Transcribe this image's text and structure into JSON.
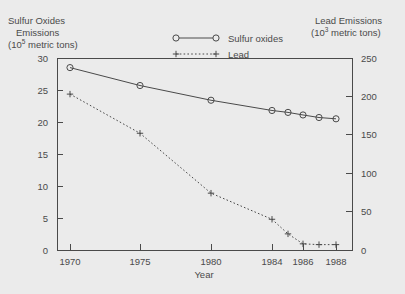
{
  "chart_data": {
    "type": "line",
    "title": "",
    "background_color": "#ebebeb",
    "frame_color": "#4a4a4a",
    "grid": false,
    "legend_position": "top-center",
    "x": [
      1970,
      1975,
      1980,
      1984,
      1985,
      1986,
      1987,
      1988
    ],
    "xlabel": "Year",
    "xtick_labels": [
      "1970",
      "1975",
      "1980",
      "1984",
      "1986",
      "1988"
    ],
    "xtick_values": [
      1970,
      1975,
      1980,
      1984,
      1986,
      1988
    ],
    "left_axis": {
      "label_line1": "Sulfur Oxides",
      "label_line2": "Emissions",
      "label_line3_prefix": "(10",
      "label_line3_exponent": "5",
      "label_line3_suffix": " metric tons)",
      "ylim": [
        0,
        30
      ],
      "ticks": [
        0,
        5,
        10,
        15,
        20,
        25,
        30
      ],
      "tick_labels": [
        "0",
        "5",
        "10",
        "15",
        "20",
        "25",
        "30"
      ]
    },
    "right_axis": {
      "label_line1": "Lead Emissions",
      "label_line2_prefix": "(10",
      "label_line2_exponent": "3",
      "label_line2_suffix": " metric tons)",
      "ylim": [
        0,
        250
      ],
      "ticks": [
        0,
        50,
        100,
        150,
        200,
        250
      ],
      "tick_labels": [
        "0",
        "50",
        "100",
        "150",
        "200",
        "250"
      ]
    },
    "series": [
      {
        "name": "Sulfur oxides",
        "axis": "left",
        "marker": "circle",
        "line_style": "solid",
        "color": "#4a4a4a",
        "values": [
          28.5,
          25.7,
          23.4,
          21.8,
          21.5,
          21.1,
          20.7,
          20.5
        ]
      },
      {
        "name": "Lead",
        "axis": "right",
        "marker": "plus",
        "line_style": "dotted",
        "color": "#4a4a4a",
        "values": [
          203.0,
          152.0,
          74.0,
          40.0,
          21.0,
          8.0,
          7.0,
          7.0
        ]
      }
    ],
    "legend": [
      {
        "label": "Sulfur oxides",
        "marker": "circle",
        "line_style": "solid"
      },
      {
        "label": "Lead",
        "marker": "plus",
        "line_style": "dotted"
      }
    ]
  }
}
